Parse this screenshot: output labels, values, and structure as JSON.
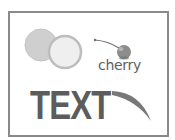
{
  "illustration": {
    "cherry_label": "cherry",
    "big_text": "TEXT",
    "icons": [
      "overlapping-circles-icon",
      "cherry-icon",
      "swoosh-icon"
    ],
    "colors": {
      "frame_border": "#8a8a8a",
      "circle_back_fill": "#cfcfcf",
      "circle_front_fill": "#ededed",
      "circle_front_ring": "#bdbdbd",
      "cherry_body": "#8c8c8c",
      "text": "#5c5c5c",
      "swoosh": "#787878"
    }
  }
}
